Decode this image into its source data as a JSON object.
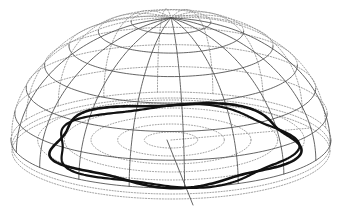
{
  "figure": {
    "background": "#ffffff",
    "colors": {
      "grid_front": "#555555",
      "grid_back": "#8a8a8a",
      "curve": "#111111"
    },
    "dome": {
      "center_x": 171,
      "base_y": 140,
      "radius_x": 160,
      "radius_y_base": 48,
      "apex_y": 18,
      "latitude_count": 7,
      "meridian_count": 18
    },
    "base_rings": {
      "count": 5,
      "style": "dotted"
    },
    "curve": {
      "style": "thick double-band wavy closed loop",
      "lobes": 5
    }
  }
}
